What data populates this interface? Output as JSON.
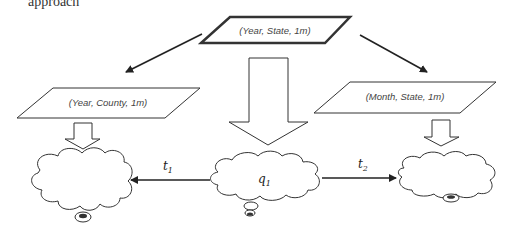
{
  "diagram": {
    "top_cut_text": "approach",
    "root_node": {
      "label": "(Year, State, 1m)"
    },
    "child_nodes": [
      {
        "id": "left",
        "label": "(Year, County, 1m)"
      },
      {
        "id": "right",
        "label": "(Month, State, 1m)"
      }
    ],
    "clouds": [
      {
        "id": "left-cloud",
        "label": ""
      },
      {
        "id": "center-cloud",
        "label": "q",
        "subscript": "1"
      },
      {
        "id": "right-cloud",
        "label": ""
      }
    ],
    "transitions": [
      {
        "id": "t1",
        "label": "t",
        "subscript": "1",
        "from": "center-cloud",
        "to": "left-cloud"
      },
      {
        "id": "t2",
        "label": "t",
        "subscript": "2",
        "from": "center-cloud",
        "to": "right-cloud"
      }
    ],
    "colors": {
      "stroke": "#222222",
      "background": "#ffffff"
    }
  }
}
